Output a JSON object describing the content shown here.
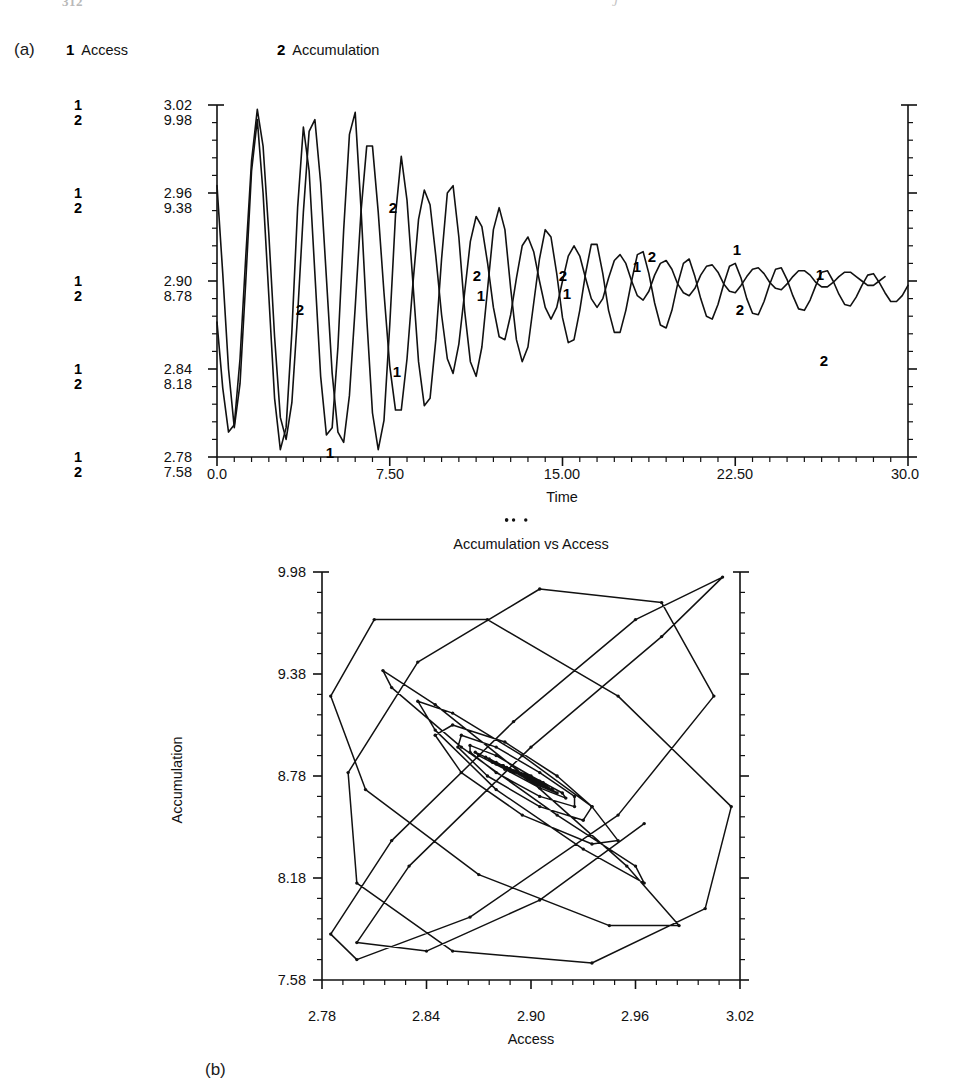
{
  "top_remnant": {
    "left_text": "312",
    "right_text": "J"
  },
  "panels": {
    "a": {
      "tag": "(a)",
      "legend": [
        {
          "key": "1",
          "label": "Access"
        },
        {
          "key": "2",
          "label": "Accumulation"
        }
      ],
      "x_title": "Time",
      "x_ticks": [
        "0.0",
        "7.50",
        "15.00",
        "22.50",
        "30.0"
      ],
      "y_ticks_access": [
        "3.02",
        "2.96",
        "2.90",
        "2.84",
        "2.78"
      ],
      "y_ticks_accumulation": [
        "9.98",
        "9.38",
        "8.78",
        "8.18",
        "7.58"
      ],
      "y_keys": [
        "1",
        "2"
      ],
      "inline_labels": [
        "2",
        "1",
        "2",
        "1",
        "2",
        "1",
        "2",
        "1",
        "1",
        "2",
        "1",
        "2",
        "1",
        "2"
      ]
    },
    "b": {
      "tag": "(b)",
      "title": "Accumulation vs Access",
      "x_title": "Access",
      "y_title": "Accumulation",
      "x_ticks": [
        "2.78",
        "2.84",
        "2.90",
        "2.96",
        "3.02"
      ],
      "y_ticks": [
        "9.98",
        "9.38",
        "8.78",
        "8.18",
        "7.58"
      ]
    }
  },
  "colors": {
    "ink": "#111111",
    "background": "#ffffff"
  },
  "chart_data": [
    {
      "type": "line",
      "id": "panel-a-timeseries",
      "title": "",
      "xlabel": "Time",
      "ylabel": "",
      "xlim": [
        0.0,
        30.0
      ],
      "grid": false,
      "legend_position": "top",
      "dual_axis": true,
      "axes": [
        {
          "name": "Access",
          "series_key": "1",
          "ylim": [
            2.78,
            3.02
          ],
          "yticks": [
            2.78,
            2.84,
            2.9,
            2.96,
            3.02
          ]
        },
        {
          "name": "Accumulation",
          "series_key": "2",
          "ylim": [
            7.58,
            9.98
          ],
          "yticks": [
            7.58,
            8.18,
            8.78,
            9.38,
            9.98
          ]
        }
      ],
      "x": [
        0.0,
        0.25,
        0.5,
        0.75,
        1.0,
        1.25,
        1.5,
        1.75,
        2.0,
        2.25,
        2.5,
        2.75,
        3.0,
        3.25,
        3.5,
        3.75,
        4.0,
        4.25,
        4.5,
        4.75,
        5.0,
        5.25,
        5.5,
        5.75,
        6.0,
        6.25,
        6.5,
        6.75,
        7.0,
        7.25,
        7.5,
        7.75,
        8.0,
        8.25,
        8.5,
        8.75,
        9.0,
        9.25,
        9.5,
        9.75,
        10.0,
        10.25,
        10.5,
        10.75,
        11.0,
        11.25,
        11.5,
        11.75,
        12.0,
        12.25,
        12.5,
        12.75,
        13.0,
        13.25,
        13.5,
        13.75,
        14.0,
        14.25,
        14.5,
        14.75,
        15.0,
        15.25,
        15.5,
        15.75,
        16.0,
        16.25,
        16.5,
        16.75,
        17.0,
        17.25,
        17.5,
        17.75,
        18.0,
        18.25,
        18.5,
        18.75,
        19.0,
        19.25,
        19.5,
        19.75,
        20.0,
        20.25,
        20.5,
        20.75,
        21.0,
        21.25,
        21.5,
        21.75,
        22.0,
        22.25,
        22.5,
        22.75,
        23.0,
        23.25,
        23.5,
        23.75,
        24.0,
        24.25,
        24.5,
        24.75,
        25.0,
        25.25,
        25.5,
        25.75,
        26.0,
        26.25,
        26.5,
        26.75,
        27.0,
        27.25,
        27.5,
        27.75,
        28.0,
        28.25,
        28.5,
        28.75,
        29.0,
        29.25,
        29.5,
        29.75,
        30.0
      ],
      "series": [
        {
          "name": "Access",
          "key": "1",
          "axis": "Access",
          "values": [
            2.965,
            2.905,
            2.84,
            2.8,
            2.83,
            2.9,
            2.975,
            3.01,
            2.96,
            2.89,
            2.82,
            2.785,
            2.8,
            2.865,
            2.95,
            3.005,
            2.975,
            2.905,
            2.835,
            2.795,
            2.8,
            2.855,
            2.935,
            3.0,
            3.015,
            2.95,
            2.875,
            2.81,
            2.785,
            2.805,
            2.87,
            2.945,
            2.985,
            2.955,
            2.9,
            2.845,
            2.815,
            2.82,
            2.86,
            2.915,
            2.96,
            2.965,
            2.93,
            2.88,
            2.845,
            2.835,
            2.855,
            2.895,
            2.935,
            2.95,
            2.935,
            2.895,
            2.86,
            2.845,
            2.855,
            2.885,
            2.915,
            2.935,
            2.93,
            2.905,
            2.875,
            2.858,
            2.86,
            2.88,
            2.905,
            2.925,
            2.925,
            2.905,
            2.88,
            2.865,
            2.865,
            2.88,
            2.9,
            2.918,
            2.92,
            2.905,
            2.885,
            2.87,
            2.868,
            2.88,
            2.898,
            2.912,
            2.915,
            2.903,
            2.888,
            2.876,
            2.874,
            2.884,
            2.898,
            2.91,
            2.912,
            2.902,
            2.888,
            2.878,
            2.877,
            2.886,
            2.898,
            2.908,
            2.909,
            2.901,
            2.89,
            2.881,
            2.88,
            2.887,
            2.897,
            2.906,
            2.907,
            2.9,
            2.891,
            2.884,
            2.883,
            2.889,
            2.897,
            2.904,
            2.905,
            2.899,
            2.892,
            2.886,
            2.886,
            2.89,
            2.897
          ]
        },
        {
          "name": "Accumulation",
          "key": "2",
          "axis": "Accumulation",
          "values": [
            8.5,
            8.05,
            7.75,
            7.8,
            8.25,
            8.95,
            9.6,
            9.95,
            9.7,
            9.1,
            8.4,
            7.85,
            7.7,
            7.95,
            8.55,
            9.25,
            9.8,
            9.88,
            9.45,
            8.8,
            8.15,
            7.75,
            7.68,
            8.0,
            8.6,
            9.25,
            9.7,
            9.7,
            9.25,
            8.7,
            8.2,
            7.9,
            7.9,
            8.25,
            8.75,
            9.2,
            9.4,
            9.3,
            8.95,
            8.55,
            8.25,
            8.15,
            8.35,
            8.7,
            9.05,
            9.22,
            9.15,
            8.9,
            8.6,
            8.4,
            8.38,
            8.55,
            8.8,
            9.02,
            9.08,
            8.98,
            8.78,
            8.6,
            8.52,
            8.6,
            8.78,
            8.95,
            9.02,
            8.95,
            8.8,
            8.66,
            8.6,
            8.66,
            8.8,
            8.92,
            8.96,
            8.9,
            8.78,
            8.68,
            8.65,
            8.71,
            8.82,
            8.9,
            8.92,
            8.86,
            8.76,
            8.7,
            8.68,
            8.73,
            8.82,
            8.88,
            8.89,
            8.84,
            8.76,
            8.71,
            8.7,
            8.75,
            8.81,
            8.86,
            8.87,
            8.83,
            8.77,
            8.73,
            8.72,
            8.76,
            8.81,
            8.85,
            8.85,
            8.82,
            8.77,
            8.74,
            8.74,
            8.77,
            8.81,
            8.84,
            8.84,
            8.81,
            8.78,
            8.75,
            8.75,
            8.78,
            8.81
          ]
        }
      ]
    },
    {
      "type": "line",
      "id": "panel-b-phase-portrait",
      "title": "Accumulation vs Access",
      "xlabel": "Access",
      "ylabel": "Accumulation",
      "xlim": [
        2.78,
        3.02
      ],
      "ylim": [
        7.58,
        9.98
      ],
      "xticks": [
        2.78,
        2.84,
        2.9,
        2.96,
        3.02
      ],
      "yticks": [
        7.58,
        8.18,
        8.78,
        9.38,
        9.98
      ],
      "grid": false,
      "markers": true,
      "legend_position": "none",
      "description": "Inward spiral trajectory of Accumulation plotted against Access, converging on a fixed point near (2.895, 8.78)",
      "series": [
        {
          "name": "trajectory",
          "x": [
            2.965,
            2.905,
            2.84,
            2.8,
            2.83,
            2.9,
            2.975,
            3.01,
            2.96,
            2.89,
            2.82,
            2.785,
            2.8,
            2.865,
            2.95,
            3.005,
            2.975,
            2.905,
            2.835,
            2.795,
            2.8,
            2.855,
            2.935,
            3.0,
            3.015,
            2.95,
            2.875,
            2.81,
            2.785,
            2.805,
            2.87,
            2.945,
            2.985,
            2.955,
            2.9,
            2.845,
            2.815,
            2.82,
            2.86,
            2.915,
            2.96,
            2.965,
            2.93,
            2.88,
            2.845,
            2.835,
            2.855,
            2.895,
            2.935,
            2.95,
            2.935,
            2.895,
            2.86,
            2.845,
            2.855,
            2.885,
            2.915,
            2.935,
            2.93,
            2.905,
            2.875,
            2.858,
            2.86,
            2.88,
            2.905,
            2.925,
            2.925,
            2.905,
            2.88,
            2.865,
            2.865,
            2.88,
            2.9,
            2.918,
            2.92,
            2.905,
            2.885,
            2.87,
            2.868,
            2.88,
            2.898,
            2.912,
            2.915,
            2.903,
            2.888,
            2.876,
            2.874,
            2.884,
            2.898,
            2.91,
            2.912,
            2.902,
            2.888,
            2.878,
            2.877,
            2.886,
            2.898,
            2.908,
            2.909,
            2.901,
            2.89,
            2.881,
            2.88,
            2.887,
            2.897,
            2.906,
            2.907,
            2.9,
            2.891,
            2.884,
            2.883,
            2.889,
            2.897,
            2.904,
            2.905,
            2.899,
            2.892,
            2.886,
            2.886,
            2.89,
            2.897
          ],
          "y": [
            8.5,
            8.05,
            7.75,
            7.8,
            8.25,
            8.95,
            9.6,
            9.95,
            9.7,
            9.1,
            8.4,
            7.85,
            7.7,
            7.95,
            8.55,
            9.25,
            9.8,
            9.88,
            9.45,
            8.8,
            8.15,
            7.75,
            7.68,
            8.0,
            8.6,
            9.25,
            9.7,
            9.7,
            9.25,
            8.7,
            8.2,
            7.9,
            7.9,
            8.25,
            8.75,
            9.2,
            9.4,
            9.3,
            8.95,
            8.55,
            8.25,
            8.15,
            8.35,
            8.7,
            9.05,
            9.22,
            9.15,
            8.9,
            8.6,
            8.4,
            8.38,
            8.55,
            8.8,
            9.02,
            9.08,
            8.98,
            8.78,
            8.6,
            8.52,
            8.6,
            8.78,
            8.95,
            9.02,
            8.95,
            8.8,
            8.66,
            8.6,
            8.66,
            8.8,
            8.92,
            8.96,
            8.9,
            8.78,
            8.68,
            8.65,
            8.71,
            8.82,
            8.9,
            8.92,
            8.86,
            8.76,
            8.7,
            8.68,
            8.73,
            8.82,
            8.88,
            8.89,
            8.84,
            8.76,
            8.71,
            8.7,
            8.75,
            8.81,
            8.86,
            8.87,
            8.83,
            8.77,
            8.73,
            8.72,
            8.76,
            8.81,
            8.85,
            8.85,
            8.82,
            8.77,
            8.74,
            8.74,
            8.77,
            8.81,
            8.84,
            8.84,
            8.81,
            8.78,
            8.75,
            8.75,
            8.78,
            8.81
          ]
        }
      ]
    }
  ]
}
